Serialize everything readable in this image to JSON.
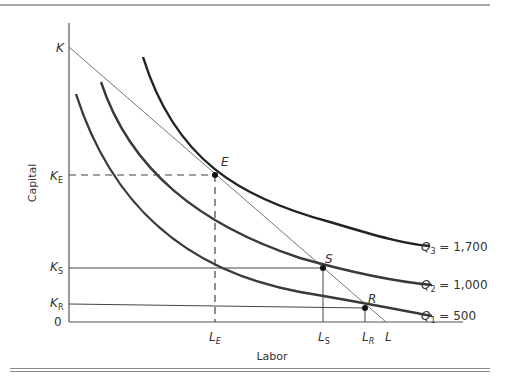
{
  "figure": {
    "type": "isoquant-isocost",
    "axes": {
      "x_label": "Labor",
      "y_label": "Capital",
      "origin_label": "0"
    },
    "budget_line": {
      "start_label": "K",
      "end_label": "L"
    },
    "isoquants": [
      {
        "name": "Q1",
        "base": "Q",
        "sub": "1",
        "value_text": " = 500",
        "value": 500
      },
      {
        "name": "Q2",
        "base": "Q",
        "sub": "2",
        "value_text": " = 1,000",
        "value": 1000
      },
      {
        "name": "Q3",
        "base": "Q",
        "sub": "3",
        "value_text": " = 1,700",
        "value": 1700
      }
    ],
    "points": [
      {
        "name": "E",
        "label": "E",
        "k_base": "K",
        "k_sub": "E",
        "l_base": "L",
        "l_sub": "E",
        "guide": "dashed"
      },
      {
        "name": "S",
        "label": "S",
        "k_base": "K",
        "k_sub": "S",
        "l_base": "L",
        "l_sub": "S",
        "guide": "solid"
      },
      {
        "name": "R",
        "label": "R",
        "k_base": "K",
        "k_sub": "R",
        "l_base": "L",
        "l_sub": "R",
        "guide": "solid"
      }
    ]
  }
}
